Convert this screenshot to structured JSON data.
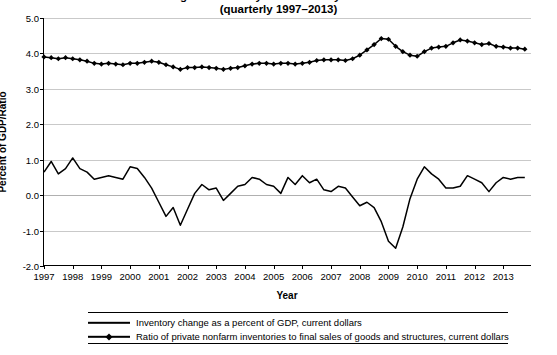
{
  "chart_data": {
    "type": "line",
    "title": "Change in Inventory and Inventory Sales Ratio",
    "subtitle": "(quarterly 1997–2013)",
    "xlabel": "Year",
    "ylabel": "Percent of GDP/Ratio",
    "ylim": [
      -2.0,
      5.0
    ],
    "ytick_labels": [
      "5.0",
      "4.0",
      "3.0",
      "2.0",
      "1.0",
      "0.0",
      "-1.0",
      "-2.0"
    ],
    "ytick_values": [
      5.0,
      4.0,
      3.0,
      2.0,
      1.0,
      0.0,
      -1.0,
      -2.0
    ],
    "xlim": [
      1997,
      2014
    ],
    "xtick_labels": [
      "1997",
      "1998",
      "1999",
      "2000",
      "2001",
      "2002",
      "2003",
      "2004",
      "2005",
      "2006",
      "2007",
      "2008",
      "2009",
      "2010",
      "2011",
      "2012",
      "2013"
    ],
    "xtick_values": [
      1997,
      1998,
      1999,
      2000,
      2001,
      2002,
      2003,
      2004,
      2005,
      2006,
      2007,
      2008,
      2009,
      2010,
      2011,
      2012,
      2013
    ],
    "grid": true,
    "legend_position": "bottom",
    "series": [
      {
        "name": "Inventory change as a percent of GDP, current dollars",
        "marker": "none",
        "color": "#000000",
        "x": [
          1997.0,
          1997.25,
          1997.5,
          1997.75,
          1998.0,
          1998.25,
          1998.5,
          1998.75,
          1999.0,
          1999.25,
          1999.5,
          1999.75,
          2000.0,
          2000.25,
          2000.5,
          2000.75,
          2001.0,
          2001.25,
          2001.5,
          2001.75,
          2002.0,
          2002.25,
          2002.5,
          2002.75,
          2003.0,
          2003.25,
          2003.5,
          2003.75,
          2004.0,
          2004.25,
          2004.5,
          2004.75,
          2005.0,
          2005.25,
          2005.5,
          2005.75,
          2006.0,
          2006.25,
          2006.5,
          2006.75,
          2007.0,
          2007.25,
          2007.5,
          2007.75,
          2008.0,
          2008.25,
          2008.5,
          2008.75,
          2009.0,
          2009.25,
          2009.5,
          2009.75,
          2010.0,
          2010.25,
          2010.5,
          2010.75,
          2011.0,
          2011.25,
          2011.5,
          2011.75,
          2012.0,
          2012.25,
          2012.5,
          2012.75,
          2013.0,
          2013.25,
          2013.5,
          2013.75
        ],
        "values": [
          0.65,
          0.95,
          0.6,
          0.75,
          1.05,
          0.75,
          0.65,
          0.45,
          0.5,
          0.55,
          0.5,
          0.45,
          0.8,
          0.75,
          0.5,
          0.2,
          -0.2,
          -0.6,
          -0.35,
          -0.85,
          -0.4,
          0.05,
          0.3,
          0.15,
          0.2,
          -0.15,
          0.05,
          0.25,
          0.3,
          0.5,
          0.45,
          0.3,
          0.25,
          0.05,
          0.5,
          0.3,
          0.55,
          0.35,
          0.45,
          0.15,
          0.1,
          0.25,
          0.2,
          -0.05,
          -0.3,
          -0.2,
          -0.35,
          -0.75,
          -1.3,
          -1.5,
          -0.9,
          -0.1,
          0.45,
          0.8,
          0.6,
          0.45,
          0.2,
          0.2,
          0.25,
          0.55,
          0.45,
          0.35,
          0.1,
          0.35,
          0.5,
          0.45,
          0.5,
          0.5
        ]
      },
      {
        "name": "Ratio of private nonfarm inventories to final sales of goods and structures, current dollars",
        "marker": "diamond",
        "color": "#000000",
        "x": [
          1997.0,
          1997.25,
          1997.5,
          1997.75,
          1998.0,
          1998.25,
          1998.5,
          1998.75,
          1999.0,
          1999.25,
          1999.5,
          1999.75,
          2000.0,
          2000.25,
          2000.5,
          2000.75,
          2001.0,
          2001.25,
          2001.5,
          2001.75,
          2002.0,
          2002.25,
          2002.5,
          2002.75,
          2003.0,
          2003.25,
          2003.5,
          2003.75,
          2004.0,
          2004.25,
          2004.5,
          2004.75,
          2005.0,
          2005.25,
          2005.5,
          2005.75,
          2006.0,
          2006.25,
          2006.5,
          2006.75,
          2007.0,
          2007.25,
          2007.5,
          2007.75,
          2008.0,
          2008.25,
          2008.5,
          2008.75,
          2009.0,
          2009.25,
          2009.5,
          2009.75,
          2010.0,
          2010.25,
          2010.5,
          2010.75,
          2011.0,
          2011.25,
          2011.5,
          2011.75,
          2012.0,
          2012.25,
          2012.5,
          2012.75,
          2013.0,
          2013.25,
          2013.5,
          2013.75
        ],
        "values": [
          3.9,
          3.88,
          3.85,
          3.88,
          3.85,
          3.82,
          3.78,
          3.72,
          3.7,
          3.72,
          3.7,
          3.68,
          3.72,
          3.72,
          3.75,
          3.78,
          3.75,
          3.68,
          3.62,
          3.55,
          3.6,
          3.6,
          3.62,
          3.6,
          3.58,
          3.55,
          3.58,
          3.6,
          3.65,
          3.7,
          3.72,
          3.72,
          3.7,
          3.72,
          3.72,
          3.7,
          3.72,
          3.75,
          3.8,
          3.82,
          3.82,
          3.82,
          3.8,
          3.85,
          3.95,
          4.1,
          4.25,
          4.42,
          4.4,
          4.2,
          4.05,
          3.95,
          3.92,
          4.05,
          4.15,
          4.18,
          4.2,
          4.3,
          4.38,
          4.35,
          4.3,
          4.25,
          4.28,
          4.2,
          4.18,
          4.15,
          4.15,
          4.12
        ]
      }
    ]
  }
}
